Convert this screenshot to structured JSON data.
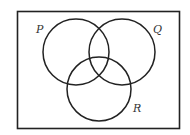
{
  "diagram": {
    "type": "venn",
    "universe": {
      "x": 17,
      "y": 11,
      "width": 163,
      "height": 118
    },
    "sets": [
      {
        "label": "P",
        "cx": 76,
        "cy": 52,
        "r": 33,
        "label_x": 37,
        "label_y": 33
      },
      {
        "label": "Q",
        "cx": 122,
        "cy": 52,
        "r": 33,
        "label_x": 154,
        "label_y": 33
      },
      {
        "label": "R",
        "cx": 99,
        "cy": 89,
        "r": 32,
        "label_x": 134,
        "label_y": 112
      }
    ],
    "stroke_color": "#222222",
    "background": "#ffffff"
  }
}
